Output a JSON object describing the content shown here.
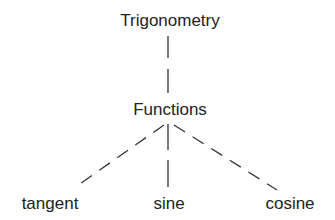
{
  "diagram": {
    "root": {
      "label": "Trigonometry"
    },
    "middle": {
      "label": "Functions"
    },
    "leaves": [
      {
        "label": "tangent"
      },
      {
        "label": "sine"
      },
      {
        "label": "cosine"
      }
    ],
    "edges": [
      {
        "from": "Trigonometry",
        "to": "Functions",
        "style": "broken-solid"
      },
      {
        "from": "Functions",
        "to": "tangent",
        "style": "dashed"
      },
      {
        "from": "Functions",
        "to": "sine",
        "style": "broken-solid"
      },
      {
        "from": "Functions",
        "to": "cosine",
        "style": "dashed"
      }
    ],
    "line_color": "#333333"
  }
}
